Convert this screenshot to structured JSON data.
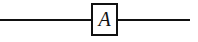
{
  "diagram": {
    "type": "quantum-circuit",
    "background_color": "#ffffff",
    "line_color": "#111111",
    "wire": {
      "label": "",
      "start_x": 0,
      "end_x": 190,
      "y": 20,
      "thickness": 2
    },
    "gates": [
      {
        "label": "A",
        "shape": "square",
        "x": 91,
        "y": 3,
        "width": 27,
        "height": 33,
        "border_color": "#111111",
        "fill_color": "#ffffff",
        "text_color": "#111111",
        "text_style": "italic-serif"
      }
    ]
  }
}
